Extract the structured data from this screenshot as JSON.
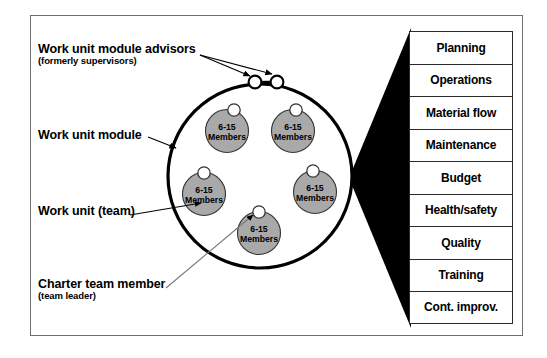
{
  "diagram": {
    "callouts": [
      {
        "id": "advisors",
        "main": "Work unit module advisors",
        "sub": "(formerly supervisors)"
      },
      {
        "id": "module",
        "main": "Work unit module",
        "sub": ""
      },
      {
        "id": "team",
        "main": "Work unit (team)",
        "sub": ""
      },
      {
        "id": "charter",
        "main": "Charter team member",
        "sub": "(team leader)"
      }
    ],
    "teams": [
      {
        "line1": "6-15",
        "line2": "Members"
      },
      {
        "line1": "6-15",
        "line2": "Members"
      },
      {
        "line1": "6-15",
        "line2": "Members"
      },
      {
        "line1": "6-15",
        "line2": "Members"
      },
      {
        "line1": "6-15",
        "line2": "Members"
      }
    ],
    "advisor_nodes": 2,
    "functions": [
      "Planning",
      "Operations",
      "Material flow",
      "Maintenance",
      "Budget",
      "Health/safety",
      "Quality",
      "Training",
      "Cont. improv."
    ],
    "colors": {
      "team_fill": "#a9a9a9",
      "team_stroke": "#333333",
      "module_stroke": "#000000",
      "wedge_fill": "#000000",
      "frame_stroke": "#6f6f6f",
      "box_stroke": "#2a2a2a",
      "node_fill": "#ffffff",
      "background": "#ffffff"
    }
  }
}
